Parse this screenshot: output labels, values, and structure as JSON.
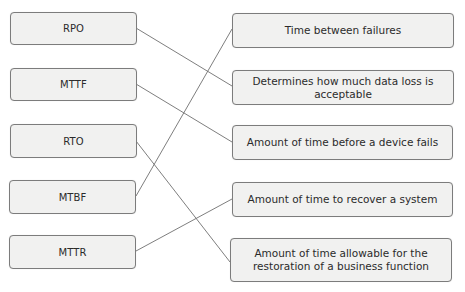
{
  "diagram": {
    "type": "matching",
    "terms": [
      {
        "id": "rpo",
        "label": "RPO"
      },
      {
        "id": "mttf",
        "label": "MTTF"
      },
      {
        "id": "rto",
        "label": "RTO"
      },
      {
        "id": "mtbf",
        "label": "MTBF"
      },
      {
        "id": "mttr",
        "label": "MTTR"
      }
    ],
    "definitions": [
      {
        "id": "d1",
        "label": "Time between failures"
      },
      {
        "id": "d2",
        "label": "Determines how much data loss is acceptable"
      },
      {
        "id": "d3",
        "label": "Amount of time before a device fails"
      },
      {
        "id": "d4",
        "label": "Amount of time to recover a system"
      },
      {
        "id": "d5",
        "label": "Amount of time allowable for the restoration of a business function"
      }
    ],
    "connections": [
      {
        "from": "RPO",
        "to": "Determines how much data loss is acceptable"
      },
      {
        "from": "MTTF",
        "to": "Amount of time before a device fails"
      },
      {
        "from": "RTO",
        "to": "Amount of time allowable for the restoration of a business function"
      },
      {
        "from": "MTBF",
        "to": "Time between failures"
      },
      {
        "from": "MTTR",
        "to": "Amount of time to recover a system"
      }
    ],
    "colors": {
      "box_fill": "#f1f1f0",
      "box_border": "#7c7c7c",
      "line": "#6f6f6f",
      "text": "#2b2b2b"
    }
  }
}
